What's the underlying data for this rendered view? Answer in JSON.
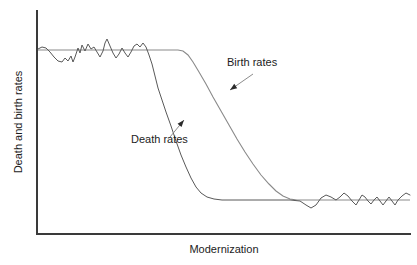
{
  "chart_data": {
    "type": "line",
    "title": "",
    "subtitle": "",
    "xlabel": "Modernization",
    "ylabel": "Death and birth rates",
    "grid": false,
    "legend_position": "inline-annotations",
    "xlim": [
      0,
      100
    ],
    "ylim": [
      0,
      100
    ],
    "axis_ticks": {
      "x": [],
      "y": []
    },
    "annotations": [
      {
        "name": "birth-rates-annotation",
        "text": "Birth rates",
        "text_x": 227,
        "text_y": 66,
        "arrow_from": [
          253,
          74
        ],
        "arrow_to": [
          230,
          90
        ]
      },
      {
        "name": "death-rates-annotation",
        "text": "Death rates",
        "text_x": 131,
        "text_y": 143,
        "arrow_from": [
          170,
          137
        ],
        "arrow_to": [
          184,
          120
        ]
      }
    ],
    "series": [
      {
        "name": "Death rates",
        "description": "High fluctuating level, then steep early decline to low stable level",
        "color": "#595959",
        "points": [
          [
            38,
            49
          ],
          [
            42,
            47
          ],
          [
            46,
            48
          ],
          [
            50,
            52
          ],
          [
            54,
            57
          ],
          [
            58,
            61
          ],
          [
            62,
            62
          ],
          [
            65,
            58
          ],
          [
            68,
            61
          ],
          [
            71,
            56
          ],
          [
            73,
            62
          ],
          [
            75,
            57
          ],
          [
            78,
            48
          ],
          [
            80,
            53
          ],
          [
            82,
            45
          ],
          [
            85,
            51
          ],
          [
            88,
            44
          ],
          [
            91,
            49
          ],
          [
            94,
            47
          ],
          [
            97,
            52
          ],
          [
            100,
            57
          ],
          [
            103,
            51
          ],
          [
            105,
            43
          ],
          [
            107,
            39
          ],
          [
            110,
            46
          ],
          [
            113,
            53
          ],
          [
            116,
            58
          ],
          [
            119,
            54
          ],
          [
            122,
            48
          ],
          [
            125,
            53
          ],
          [
            128,
            57
          ],
          [
            131,
            52
          ],
          [
            134,
            46
          ],
          [
            137,
            44
          ],
          [
            140,
            47
          ],
          [
            143,
            43
          ],
          [
            146,
            47
          ],
          [
            149,
            55
          ],
          [
            152,
            64
          ],
          [
            155,
            76
          ],
          [
            158,
            88
          ],
          [
            162,
            100
          ],
          [
            166,
            112
          ],
          [
            171,
            126
          ],
          [
            176,
            141
          ],
          [
            181,
            155
          ],
          [
            186,
            167
          ],
          [
            191,
            178
          ],
          [
            196,
            187
          ],
          [
            201,
            193
          ],
          [
            207,
            197
          ],
          [
            214,
            199
          ],
          [
            222,
            200
          ],
          [
            232,
            200
          ],
          [
            250,
            200
          ],
          [
            270,
            200
          ],
          [
            290,
            200
          ],
          [
            300,
            201
          ],
          [
            306,
            205
          ],
          [
            311,
            208
          ],
          [
            316,
            205
          ],
          [
            321,
            198
          ],
          [
            326,
            195
          ],
          [
            331,
            197
          ],
          [
            336,
            200
          ],
          [
            340,
            197
          ],
          [
            344,
            193
          ],
          [
            348,
            196
          ],
          [
            352,
            201
          ],
          [
            356,
            205
          ],
          [
            359,
            200
          ],
          [
            362,
            195
          ],
          [
            365,
            197
          ],
          [
            368,
            201
          ],
          [
            371,
            204
          ],
          [
            374,
            200
          ],
          [
            377,
            197
          ],
          [
            380,
            201
          ],
          [
            383,
            205
          ],
          [
            386,
            201
          ],
          [
            389,
            197
          ],
          [
            392,
            201
          ],
          [
            395,
            205
          ],
          [
            398,
            200
          ],
          [
            402,
            196
          ],
          [
            406,
            193
          ],
          [
            410,
            195
          ]
        ]
      },
      {
        "name": "Birth rates",
        "description": "High stable level, later decline to low stable level",
        "color": "#8a8a8a",
        "points": [
          [
            38,
            50
          ],
          [
            120,
            50
          ],
          [
            160,
            50
          ],
          [
            178,
            50
          ],
          [
            183,
            51
          ],
          [
            188,
            55
          ],
          [
            193,
            62
          ],
          [
            199,
            72
          ],
          [
            206,
            84
          ],
          [
            213,
            97
          ],
          [
            221,
            111
          ],
          [
            229,
            125
          ],
          [
            237,
            139
          ],
          [
            245,
            152
          ],
          [
            253,
            164
          ],
          [
            261,
            175
          ],
          [
            269,
            184
          ],
          [
            276,
            191
          ],
          [
            283,
            196
          ],
          [
            290,
            199
          ],
          [
            297,
            200
          ],
          [
            320,
            200
          ],
          [
            360,
            200
          ],
          [
            410,
            200
          ]
        ]
      }
    ]
  },
  "axes": {
    "y_axis_name": "y-axis",
    "x_axis_name": "x-axis",
    "origin": [
      37,
      234
    ],
    "y_top": 10,
    "x_right": 411
  },
  "labels": {
    "x_axis_label": "Modernization",
    "y_axis_label": "Death and birth rates"
  },
  "colors": {
    "axis": "#3a3a3a",
    "death_series": "#595959",
    "birth_series": "#8a8a8a",
    "text": "#1c1c1c",
    "background": "#ffffff"
  }
}
